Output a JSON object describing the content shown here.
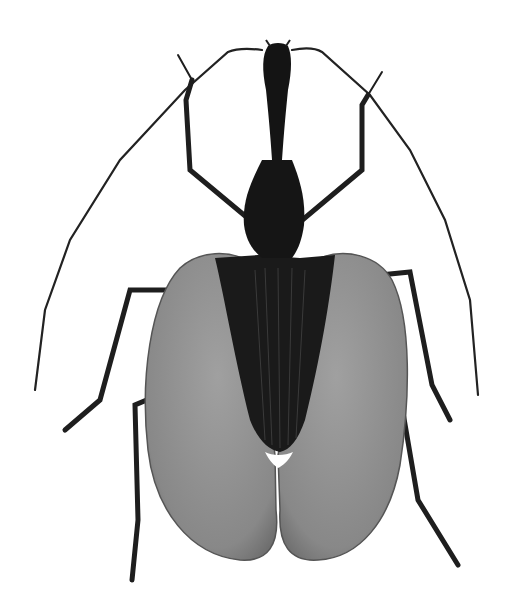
{
  "image": {
    "subject": "violin beetle",
    "background": "#ffffff",
    "colors": {
      "body": "#1a1a1a",
      "elytra_flange": "#8a8a8a",
      "elytra_edge": "#5a5a5a",
      "legs": "#1e1e1e"
    }
  }
}
